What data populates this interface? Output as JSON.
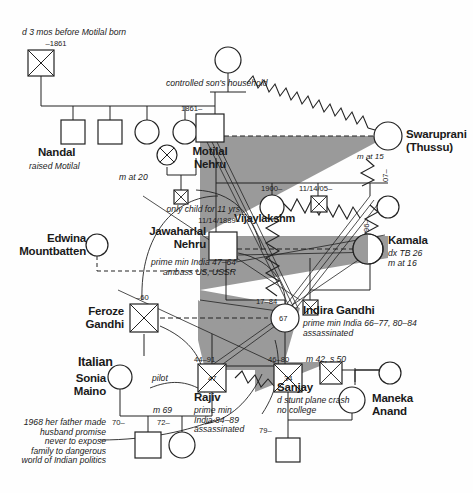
{
  "meta": {
    "type": "genogram",
    "palette": {
      "line": "#222222",
      "shade": "#9a9a9a",
      "text": "#1a1a1a",
      "background": "#ffffff"
    }
  },
  "persons": {
    "motilal_father": {
      "name": "",
      "dates": "–1861",
      "note": "d 3 mos before Motilal born",
      "symbol": "deceased-male"
    },
    "nandal": {
      "name": "Nandal",
      "note": "raised Motilal",
      "symbol": "male"
    },
    "sibling2": {
      "name": "",
      "symbol": "male"
    },
    "sibling3": {
      "name": "",
      "symbol": "female"
    },
    "sibling4": {
      "name": "",
      "symbol": "female"
    },
    "motilal_mother": {
      "name": "",
      "note": "controlled son's household",
      "symbol": "female"
    },
    "motilal": {
      "name": "Motilal\nNehru",
      "dates": "1861–",
      "symbol": "male"
    },
    "first_wife": {
      "name": "",
      "note": "m at 20",
      "symbol": "deceased-female"
    },
    "first_child": {
      "name": "",
      "symbol": "deceased-male"
    },
    "swaruprani": {
      "name": "Swaruprani\n(Thussu)",
      "note": "m at 15",
      "symbol": "female"
    },
    "jawaharlal": {
      "name": "Jawaharlal\nNehru",
      "dates": "11/14/1889–",
      "note": "only child for 11 yrs",
      "note2": "prime min India 47–64\nambass US, USSR",
      "symbol": "male"
    },
    "vijaylakshm": {
      "name": "Vijaylakshm",
      "dates": "1900–",
      "symbol": "female"
    },
    "child_1905": {
      "name": "",
      "dates": "11/14/05–",
      "symbol": "deceased-male"
    },
    "child_07": {
      "name": "",
      "dates": "07–",
      "symbol": "female"
    },
    "kamala": {
      "name": "Kamala",
      "dates": "96–",
      "note": "dx TB 26\nm at 16",
      "symbol": "female"
    },
    "edwina": {
      "name": "Edwina\nMountbatten",
      "symbol": "female"
    },
    "kamala_child": {
      "name": "",
      "symbol": "deceased-male"
    },
    "feroze": {
      "name": "Feroze\nGandhi",
      "dates": "–60",
      "symbol": "deceased-male"
    },
    "indira": {
      "name": "Indira Gandhi",
      "dates": "17–84",
      "age": "67",
      "note": "prime min India 66–77, 80–84\nassassinated",
      "symbol": "female"
    },
    "rajiv": {
      "name": "Rajiv",
      "dates": "44–91",
      "age": "47",
      "note": "pilot",
      "note2": "prime min\nIndia 84–89\nassassinated",
      "symbol": "deceased-male"
    },
    "sanjay": {
      "name": "Sanjay",
      "dates": "46–80",
      "age": "34",
      "note": "d stunt plane crash\nno college",
      "symbol": "deceased-male"
    },
    "sonia": {
      "name": "Sonia\nMaino",
      "note": "1968 her father made\nhusband promise\nnever to expose\nfamily to dangerous\nworld of Indian politics",
      "symbol": "female"
    },
    "sonia_son": {
      "name": "",
      "dates": "70–",
      "symbol": "male"
    },
    "sonia_daughter": {
      "name": "",
      "dates": "72–",
      "symbol": "female"
    },
    "maneka": {
      "name": "Maneka\nAnand",
      "symbol": "female"
    },
    "maneka_father": {
      "name": "",
      "symbol": "deceased-male"
    },
    "maneka_mother": {
      "name": "",
      "symbol": "female"
    },
    "maneka_son": {
      "name": "",
      "dates": "79–",
      "symbol": "male"
    }
  },
  "annotations": {
    "italian": "Italian",
    "marriage_rajiv": "m 69",
    "marriage_indira": "m 42, s 50"
  },
  "labels": {
    "d_3_mos": "d 3 mos before Motilal born",
    "dash_1861": "–1861",
    "nandal": "Nandal",
    "raised_motilal": "raised Motilal",
    "controlled_household": "controlled son's household",
    "y1861": "1861–",
    "motilal": "Motilal\nNehru",
    "m_at_20": "m at 20",
    "swaruprani": "Swaruprani\n(Thussu)",
    "m_at_15": "m at 15",
    "only_child": "only child for 11 yrs",
    "jnehru_dob": "11/14/1889–",
    "jawaharlal": "Jawaharlal\nNehru",
    "jnehru_note": "prime min India 47–64\nambass US, USSR",
    "edwina": "Edwina\nMountbatten",
    "y1900": "1900–",
    "vijaylakshm": "Vijaylakshm",
    "d111405": "11/14/05–",
    "y07": "07–",
    "y96": "96–",
    "kamala": "Kamala",
    "kamala_note": "dx TB 26\nm at 16",
    "feroze_d": "–60",
    "feroze": "Feroze\nGandhi",
    "indira_dates": "17–84",
    "indira_age": "67",
    "indira": "Indira Gandhi",
    "indira_note": "prime min India 66–77, 80–84\nassassinated",
    "m42s50": "m 42, s 50",
    "italian": "Italian",
    "rajiv_dates": "44–91",
    "rajiv_age": "47",
    "pilot": "pilot",
    "rajiv": "Rajiv",
    "rajiv_note": "prime min\nIndia 84–89\nassassinated",
    "sanjay_dates": "46–80",
    "sanjay_age": "34",
    "sanjay": "Sanjay",
    "sanjay_note": "d stunt plane crash\nno college",
    "sonia": "Sonia\nMaino",
    "sonia_note": "1968 her father made\nhusband promise\nnever to expose\nfamily to dangerous\nworld of Indian politics",
    "m69": "m 69",
    "y70": "70–",
    "y72": "72–",
    "maneka": "Maneka\nAnand",
    "y79": "79–"
  }
}
